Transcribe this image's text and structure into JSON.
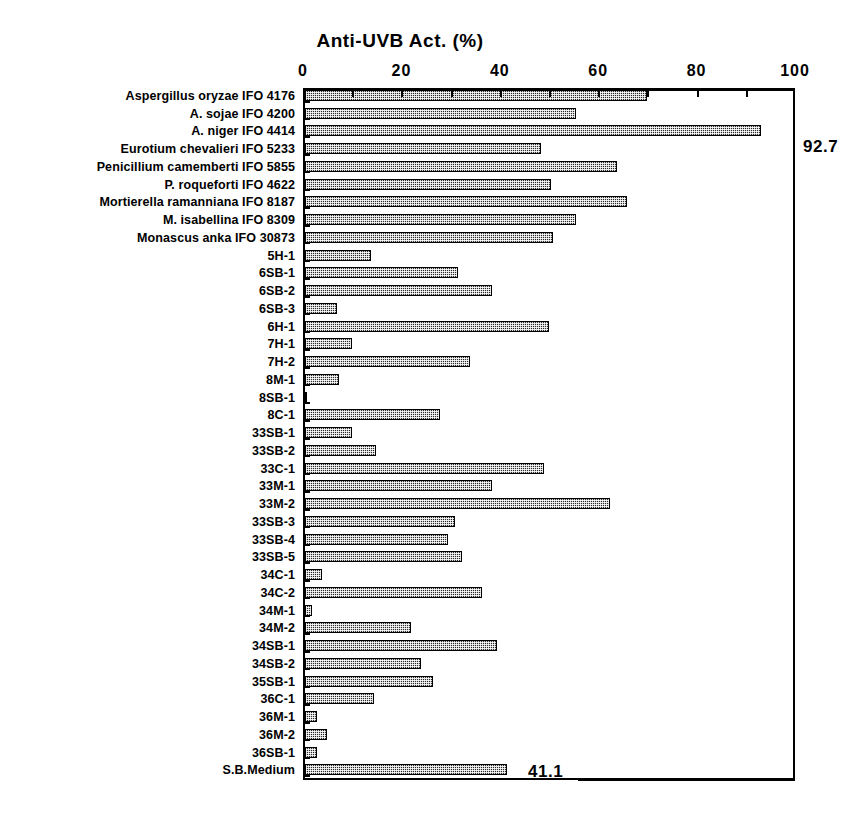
{
  "chart_data": {
    "type": "bar",
    "orientation": "horizontal",
    "title": "Anti-UVB  Act.  (%)",
    "xlabel": "Anti-UVB Act. (%)",
    "ylabel": "",
    "xlim": [
      0,
      100
    ],
    "xticks": [
      0,
      20,
      40,
      60,
      80,
      100
    ],
    "minor_tick_step": 10,
    "grid": false,
    "legend": null,
    "bar_color": "#2b2b2b",
    "bar_pattern": "dotted-stipple",
    "categories": [
      "Aspergillus oryzae IFO 4176",
      "A. sojae IFO 4200",
      "A. niger IFO 4414",
      "Eurotium chevalieri IFO 5233",
      "Penicillium camemberti IFO 5855",
      "P. roqueforti IFO 4622",
      "Mortierella ramanniana IFO 8187",
      "M. isabellina IFO 8309",
      "Monascus anka IFO 30873",
      "5H-1",
      "6SB-1",
      "6SB-2",
      "6SB-3",
      "6H-1",
      "7H-1",
      "7H-2",
      "8M-1",
      "8SB-1",
      "8C-1",
      "33SB-1",
      "33SB-2",
      "33C-1",
      "33M-1",
      "33M-2",
      "33SB-3",
      "33SB-4",
      "33SB-5",
      "34C-1",
      "34C-2",
      "34M-1",
      "34M-2",
      "34SB-1",
      "34SB-2",
      "35SB-1",
      "36C-1",
      "36M-1",
      "36M-2",
      "36SB-1",
      "S.B.Medium"
    ],
    "values": [
      69.5,
      55.0,
      92.7,
      48.0,
      63.5,
      50.0,
      65.5,
      55.0,
      50.5,
      13.5,
      31.0,
      38.0,
      6.5,
      49.5,
      9.5,
      33.5,
      7.0,
      0.5,
      27.5,
      9.5,
      14.5,
      48.5,
      38.0,
      62.0,
      30.5,
      29.0,
      32.0,
      3.5,
      36.0,
      1.5,
      21.5,
      39.0,
      23.5,
      26.0,
      14.0,
      2.5,
      4.5,
      2.5,
      41.1
    ],
    "annotations": [
      {
        "text": "92.7",
        "series_index": 2,
        "value": 92.7
      },
      {
        "text": "41.1",
        "series_index": 38,
        "value": 41.1
      }
    ]
  },
  "axis": {
    "tick_labels": [
      "0",
      "20",
      "40",
      "60",
      "80",
      "100"
    ]
  }
}
